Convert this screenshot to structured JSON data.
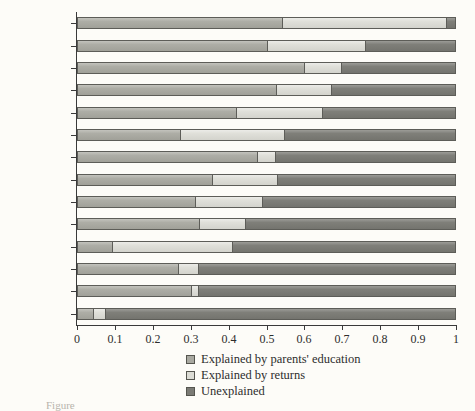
{
  "chart_data": {
    "type": "bar",
    "orientation": "horizontal",
    "stacked": true,
    "normalized": true,
    "title": "",
    "subtitle": "",
    "xlabel": "",
    "ylabel": "",
    "xlim": [
      0,
      1
    ],
    "ylim": null,
    "grid": false,
    "legend_position": "bottom-center",
    "xticks": [
      "0",
      "0.1",
      "0.2",
      "0.3",
      "0.4",
      "0.5",
      "0.6",
      "0.7",
      "0.8",
      "0.9",
      "1"
    ],
    "xtick_values": [
      0,
      0.1,
      0.2,
      0.3,
      0.4,
      0.5,
      0.6,
      0.7,
      0.8,
      0.9,
      1
    ],
    "categories": [
      "Mexico",
      "Panama",
      "Honduras",
      "El Salvador",
      "Brazil",
      "Ecuador",
      "Paraguay",
      "Venezuela",
      "Bolivia",
      "Argentina",
      "Peru",
      "Costa Rica",
      "Chile",
      "Uruguay"
    ],
    "series": [
      {
        "name": "Explained by parents' education",
        "color": "#a9a9a1",
        "values": [
          0.54,
          0.5,
          0.6,
          0.525,
          0.42,
          0.27,
          0.475,
          0.355,
          0.31,
          0.32,
          0.09,
          0.265,
          0.3,
          0.04
        ]
      },
      {
        "name": "Explained by returns",
        "color": "#dcdcd5",
        "values": [
          0.44,
          0.265,
          0.1,
          0.15,
          0.23,
          0.28,
          0.05,
          0.175,
          0.18,
          0.125,
          0.32,
          0.055,
          0.02,
          0.035
        ]
      },
      {
        "name": "Unexplained",
        "color": "#7b7b75",
        "values": [
          0.02,
          0.235,
          0.3,
          0.325,
          0.35,
          0.45,
          0.475,
          0.47,
          0.51,
          0.555,
          0.59,
          0.68,
          0.68,
          0.925
        ]
      }
    ]
  },
  "legend": {
    "items": [
      {
        "label": "Explained by parents' education",
        "swatch": "k0"
      },
      {
        "label": "Explained by returns",
        "swatch": "k1"
      },
      {
        "label": "Unexplained",
        "swatch": "k2"
      }
    ]
  },
  "caption": {
    "text": "Figure"
  }
}
